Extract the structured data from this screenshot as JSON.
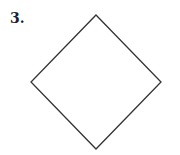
{
  "problem": {
    "number_label": "3.",
    "shape": "diamond",
    "stroke_color": "#333333",
    "vertices": {
      "top": [
        96,
        15
      ],
      "right": [
        161,
        82
      ],
      "bottom": [
        96,
        149
      ],
      "left": [
        31,
        82
      ]
    }
  }
}
